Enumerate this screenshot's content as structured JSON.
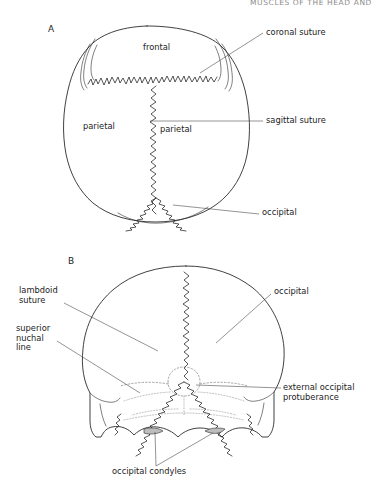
{
  "page": {
    "running_head": "MUSCLES OF THE HEAD AND",
    "width": 378,
    "height": 488,
    "background": "#ffffff",
    "ink": "#1a1a1a"
  },
  "figure": {
    "type": "anatomical-line-drawing",
    "panels": [
      {
        "id": "A",
        "letter": "A",
        "view": "superior (vertex) view of the skull",
        "letter_pos": {
          "x": 48,
          "y": 29
        },
        "inner_labels": [
          {
            "name": "frontal",
            "text": "frontal",
            "x": 143,
            "y": 48
          },
          {
            "name": "parietal-left",
            "text": "parietal",
            "x": 83,
            "y": 127
          },
          {
            "name": "parietal-right",
            "text": "parietal",
            "x": 160,
            "y": 130
          }
        ],
        "callout_labels": [
          {
            "name": "coronal-suture",
            "text": "coronal suture",
            "x": 266,
            "y": 33
          },
          {
            "name": "sagittal-suture",
            "text": "sagittal suture",
            "x": 266,
            "y": 123
          },
          {
            "name": "occipital",
            "text": "occipital",
            "x": 262,
            "y": 213
          }
        ]
      },
      {
        "id": "B",
        "letter": "B",
        "view": "posterior (occipital) view of the skull",
        "letter_pos": {
          "x": 68,
          "y": 262
        },
        "inner_labels": [],
        "callout_labels": [
          {
            "name": "lambdoid-suture",
            "text": "lambdoid\nsuture",
            "x": 19,
            "y": 291
          },
          {
            "name": "superior-nuchal-line",
            "text": "superior\nnuchal\nline",
            "x": 16,
            "y": 329
          },
          {
            "name": "occipital",
            "text": "occipital",
            "x": 274,
            "y": 292
          },
          {
            "name": "external-occipital-protuberance",
            "text": "external occipital\nprotuberance",
            "x": 283,
            "y": 388
          },
          {
            "name": "occipital-condyles",
            "text": "occipital condyles",
            "x": 112,
            "y": 472
          }
        ]
      }
    ],
    "structures_shown": [
      "frontal bone",
      "parietal bone",
      "occipital bone",
      "coronal suture",
      "sagittal suture",
      "lambdoid suture",
      "superior nuchal line",
      "external occipital protuberance",
      "occipital condyles",
      "zygomatic arch",
      "mastoid process"
    ]
  }
}
